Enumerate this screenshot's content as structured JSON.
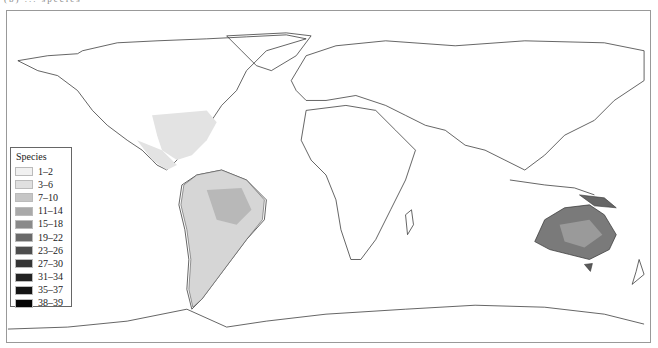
{
  "figure": {
    "panel_label": "(b) ... species"
  },
  "legend": {
    "title": "Species",
    "items": [
      {
        "label": "1–2",
        "color": "#f1f1f1"
      },
      {
        "label": "3–6",
        "color": "#e0e0e0"
      },
      {
        "label": "7–10",
        "color": "#c6c6c6"
      },
      {
        "label": "11–14",
        "color": "#a9a9a9"
      },
      {
        "label": "15–18",
        "color": "#8a8a8a"
      },
      {
        "label": "19–22",
        "color": "#6a6a6a"
      },
      {
        "label": "23–26",
        "color": "#4d4d4d"
      },
      {
        "label": "27–30",
        "color": "#353535"
      },
      {
        "label": "31–34",
        "color": "#232323"
      },
      {
        "label": "35–37",
        "color": "#141414"
      },
      {
        "label": "38–39",
        "color": "#050505"
      }
    ]
  },
  "regions": [
    {
      "name": "North America (eastern US / Mexico)",
      "range": "1–6"
    },
    {
      "name": "Central America",
      "range": "3–10"
    },
    {
      "name": "South America (Amazon / Brazil)",
      "range": "3–22"
    },
    {
      "name": "Australia",
      "range": "11–30"
    },
    {
      "name": "New Guinea",
      "range": "15–26"
    }
  ]
}
